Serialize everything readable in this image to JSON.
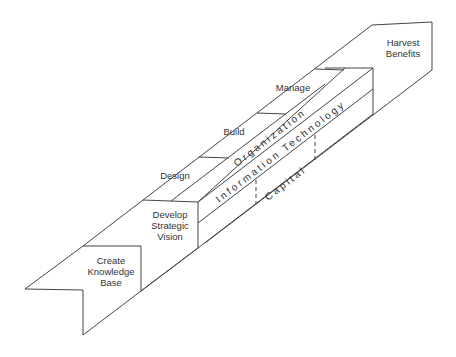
{
  "diagram": {
    "title": "",
    "stages": {
      "create": {
        "line1": "Create",
        "line2": "Knowledge",
        "line3": "Base"
      },
      "develop": {
        "line1": "Develop",
        "line2": "Strategic",
        "line3": "Vision"
      },
      "harvest": {
        "line1": "Harvest",
        "line2": "Benefits"
      }
    },
    "steps": {
      "design": "Design",
      "build": "Build",
      "manage": "Manage"
    },
    "layers": {
      "organization": "Organization",
      "it": "Information Technology",
      "capital": "Capital"
    },
    "colors": {
      "line": "#444444",
      "text": "#333333",
      "background": "#ffffff"
    }
  }
}
